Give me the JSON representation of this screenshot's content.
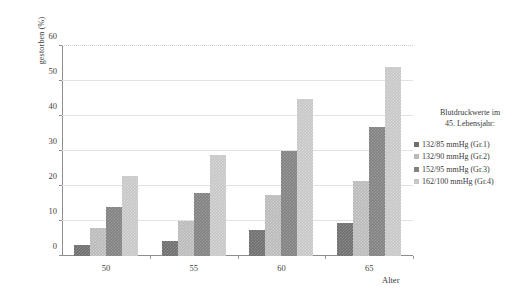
{
  "chart_data": {
    "type": "bar",
    "title": "",
    "xlabel": "Alter",
    "ylabel": "gestorben (%)",
    "categories": [
      "50",
      "55",
      "60",
      "65"
    ],
    "ylim": [
      0,
      60
    ],
    "yticks": [
      0,
      10,
      20,
      30,
      40,
      50,
      60
    ],
    "grid": true,
    "legend_position": "right",
    "legend_title_line1": "Blutdruckwerte im",
    "legend_title_line2": "45. Lebensjahr:",
    "series": [
      {
        "name": "132/85 mmHg (Gr.1)",
        "color": "#6f6f6f",
        "values": [
          3.2,
          4.3,
          7.5,
          9.5
        ]
      },
      {
        "name": "132/90 mmHg (Gr.2)",
        "color": "#b9b9b9",
        "values": [
          8.0,
          10.0,
          17.5,
          21.5
        ]
      },
      {
        "name": "152/95 mmHg (Gr.3)",
        "color": "#828282",
        "values": [
          14.0,
          18.0,
          30.0,
          37.0
        ]
      },
      {
        "name": "162/100 mmHg (Gr.4)",
        "color": "#c6c6c6",
        "values": [
          23.0,
          29.0,
          45.0,
          54.0
        ]
      }
    ]
  }
}
